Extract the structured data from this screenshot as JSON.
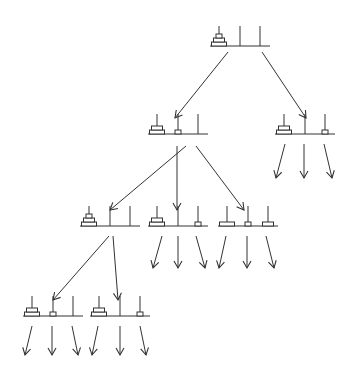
{
  "diagram": {
    "stroke_color": "#333333",
    "disc_fill": "#ffffff",
    "disc_widths": {
      "large": 15,
      "medium": 11,
      "small": 6
    },
    "disc_height": 4,
    "peg_height": 20,
    "nodes": [
      {
        "id": "root",
        "x": 210,
        "y": 46,
        "pegs": [
          [
            "large",
            "medium",
            "small"
          ],
          [],
          []
        ]
      },
      {
        "id": "n1",
        "x": 148,
        "y": 134,
        "pegs": [
          [
            "large",
            "medium"
          ],
          [
            "small"
          ],
          []
        ]
      },
      {
        "id": "n2",
        "x": 275,
        "y": 134,
        "pegs": [
          [
            "large",
            "medium"
          ],
          [],
          [
            "small"
          ]
        ]
      },
      {
        "id": "n3",
        "x": 80,
        "y": 226,
        "pegs": [
          [
            "large",
            "medium",
            "small"
          ],
          [],
          []
        ]
      },
      {
        "id": "n4",
        "x": 148,
        "y": 226,
        "pegs": [
          [
            "large",
            "medium"
          ],
          [],
          [
            "small"
          ]
        ]
      },
      {
        "id": "n5",
        "x": 218,
        "y": 226,
        "pegs": [
          [
            "large"
          ],
          [
            "small"
          ],
          [
            "medium"
          ]
        ]
      },
      {
        "id": "n6",
        "x": 23,
        "y": 316,
        "pegs": [
          [
            "large",
            "medium"
          ],
          [
            "small"
          ],
          []
        ]
      },
      {
        "id": "n7",
        "x": 90,
        "y": 316,
        "pegs": [
          [
            "large",
            "medium"
          ],
          [],
          [
            "small"
          ]
        ]
      }
    ],
    "edges": [
      {
        "from": [
          228,
          52
        ],
        "to": [
          175,
          118
        ]
      },
      {
        "from": [
          262,
          52
        ],
        "to": [
          306,
          118
        ]
      },
      {
        "from": [
          186,
          146
        ],
        "to": [
          110,
          210
        ]
      },
      {
        "from": [
          177,
          146
        ],
        "to": [
          177,
          210
        ]
      },
      {
        "from": [
          196,
          146
        ],
        "to": [
          244,
          210
        ]
      },
      {
        "from": [
          109,
          236
        ],
        "to": [
          53,
          300
        ]
      },
      {
        "from": [
          113,
          236
        ],
        "to": [
          118,
          300
        ]
      },
      {
        "from": [
          285,
          144
        ],
        "to": [
          276,
          178
        ]
      },
      {
        "from": [
          304,
          144
        ],
        "to": [
          304,
          178
        ]
      },
      {
        "from": [
          324,
          144
        ],
        "to": [
          332,
          178
        ]
      },
      {
        "from": [
          162,
          236
        ],
        "to": [
          153,
          268
        ]
      },
      {
        "from": [
          178,
          236
        ],
        "to": [
          178,
          268
        ]
      },
      {
        "from": [
          196,
          236
        ],
        "to": [
          205,
          268
        ]
      },
      {
        "from": [
          226,
          236
        ],
        "to": [
          219,
          268
        ]
      },
      {
        "from": [
          247,
          236
        ],
        "to": [
          247,
          268
        ]
      },
      {
        "from": [
          266,
          236
        ],
        "to": [
          274,
          268
        ]
      },
      {
        "from": [
          32,
          326
        ],
        "to": [
          25,
          355
        ]
      },
      {
        "from": [
          52,
          326
        ],
        "to": [
          52,
          355
        ]
      },
      {
        "from": [
          72,
          326
        ],
        "to": [
          78,
          355
        ]
      },
      {
        "from": [
          98,
          326
        ],
        "to": [
          92,
          355
        ]
      },
      {
        "from": [
          120,
          326
        ],
        "to": [
          120,
          355
        ]
      },
      {
        "from": [
          140,
          326
        ],
        "to": [
          146,
          355
        ]
      }
    ]
  }
}
